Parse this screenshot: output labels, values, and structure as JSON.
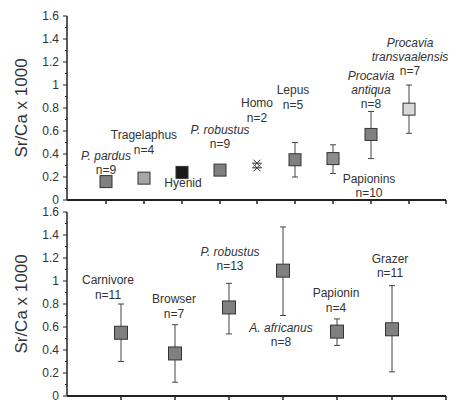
{
  "chart_data": [
    {
      "type": "scatter",
      "title": "",
      "ylabel": "Sr/Ca x 1000",
      "xlabel": "",
      "ylim": [
        0,
        1.6
      ],
      "yticks": [
        "0",
        "0.2",
        "0.4",
        "0.6",
        "0.8",
        "1",
        "1.2",
        "1.4",
        "1.6"
      ],
      "grid": false,
      "legend": "none",
      "categories": [
        "P. pardus",
        "Tragelaphus",
        "Hyenid",
        "P. robustus",
        "Homo",
        "Lepus",
        "Papionins",
        "Procavia antiqua",
        "Procavia transvaalensis"
      ],
      "series": [
        {
          "name": "P. pardus",
          "n": "n=9",
          "mean": 0.16,
          "err_low": null,
          "err_high": null,
          "italic": true,
          "color": "#808080"
        },
        {
          "name": "Tragelaphus",
          "n": "n=4",
          "mean": 0.19,
          "err_low": 0.17,
          "err_high": 0.21,
          "italic": false,
          "color": "#a6a6a6"
        },
        {
          "name": "Hyenid",
          "n": "",
          "mean": 0.24,
          "err_low": null,
          "err_high": null,
          "italic": false,
          "color": "#1a1a1a"
        },
        {
          "name": "P. robustus",
          "n": "n=9",
          "mean": 0.26,
          "err_low": null,
          "err_high": null,
          "italic": true,
          "color": "#808080"
        },
        {
          "name": "Homo",
          "n": "n=2",
          "values": [
            0.28,
            0.32
          ],
          "marker": "asterisk",
          "italic": false,
          "color": "#333333"
        },
        {
          "name": "Lepus",
          "n": "n=5",
          "mean": 0.35,
          "err_low": 0.2,
          "err_high": 0.5,
          "italic": false,
          "color": "#808080"
        },
        {
          "name": "Papionins",
          "n": "n=10",
          "mean": 0.36,
          "err_low": 0.23,
          "err_high": 0.48,
          "italic": false,
          "color": "#8c8c8c"
        },
        {
          "name": "Procavia antiqua",
          "n": "n=8",
          "mean": 0.57,
          "err_low": 0.36,
          "err_high": 0.77,
          "italic": true,
          "color": "#808080"
        },
        {
          "name": "Procavia transvaalensis",
          "n": "n=7",
          "mean": 0.79,
          "err_low": 0.58,
          "err_high": 1.0,
          "italic": true,
          "color": "#d9d9d9"
        }
      ]
    },
    {
      "type": "scatter",
      "title": "",
      "ylabel": "Sr/Ca x 1000",
      "xlabel": "",
      "ylim": [
        0,
        1.6
      ],
      "yticks": [
        "0",
        "0.2",
        "0.4",
        "0.6",
        "0.8",
        "1",
        "1.2",
        "1.4",
        "1.6"
      ],
      "grid": false,
      "legend": "none",
      "categories": [
        "Carnivore",
        "Browser",
        "P. robustus",
        "A. africanus",
        "Papionin",
        "Grazer"
      ],
      "series": [
        {
          "name": "Carnivore",
          "n": "n=11",
          "mean": 0.55,
          "err_low": 0.3,
          "err_high": 0.8,
          "italic": false,
          "color": "#808080"
        },
        {
          "name": "Browser",
          "n": "n=7",
          "mean": 0.37,
          "err_low": 0.12,
          "err_high": 0.62,
          "italic": false,
          "color": "#808080"
        },
        {
          "name": "P. robustus",
          "n": "n=13",
          "mean": 0.77,
          "err_low": 0.54,
          "err_high": 0.98,
          "italic": true,
          "color": "#808080"
        },
        {
          "name": "A. africanus",
          "n": "n=8",
          "mean": 1.09,
          "err_low": 0.7,
          "err_high": 1.47,
          "italic": true,
          "color": "#808080"
        },
        {
          "name": "Papionin",
          "n": "n=4",
          "mean": 0.56,
          "err_low": 0.44,
          "err_high": 0.67,
          "italic": false,
          "color": "#808080"
        },
        {
          "name": "Grazer",
          "n": "n=11",
          "mean": 0.58,
          "err_low": 0.21,
          "err_high": 0.96,
          "italic": false,
          "color": "#808080"
        }
      ]
    }
  ],
  "layout": {
    "top": {
      "plot_left": 67,
      "plot_right": 446,
      "y0": 200,
      "y16": 16,
      "xs": [
        106,
        144,
        182,
        220,
        257,
        295,
        333,
        371,
        409
      ],
      "xticks": [
        106,
        144,
        182,
        220,
        257,
        295,
        333,
        371,
        409,
        446
      ],
      "labels": [
        {
          "lines": [
            "P. pardus",
            "n=9"
          ],
          "x": 106,
          "y": [
            160,
            174
          ],
          "italic": [
            true,
            false
          ]
        },
        {
          "lines": [
            "Tragelaphus",
            "n=4"
          ],
          "x": 144,
          "y": [
            139,
            154
          ],
          "italic": [
            false,
            false
          ]
        },
        {
          "lines": [
            "Hyenid"
          ],
          "x": 183,
          "y": [
            187
          ],
          "italic": [
            false
          ]
        },
        {
          "lines": [
            "P. robustus",
            "n=9"
          ],
          "x": 220,
          "y": [
            134,
            148
          ],
          "italic": [
            true,
            false
          ]
        },
        {
          "lines": [
            "Homo",
            "n=2"
          ],
          "x": 257,
          "y": [
            107,
            122
          ],
          "italic": [
            false,
            false
          ]
        },
        {
          "lines": [
            "Lepus",
            "n=5"
          ],
          "x": 293,
          "y": [
            94,
            109
          ],
          "italic": [
            false,
            false
          ]
        },
        {
          "lines": [
            "Papionins",
            "n=10"
          ],
          "x": 369,
          "y": [
            183,
            197
          ],
          "italic": [
            false,
            false
          ]
        },
        {
          "lines": [
            "Procavia",
            "antiqua",
            "n=8"
          ],
          "x": 371,
          "y": [
            80,
            94,
            108
          ],
          "italic": [
            true,
            true,
            false
          ]
        },
        {
          "lines": [
            "Procavia",
            "transvaalensis",
            "n=7"
          ],
          "x": 410,
          "y": [
            47,
            61,
            75
          ],
          "italic": [
            true,
            true,
            false
          ]
        }
      ]
    },
    "bottom": {
      "plot_left": 67,
      "plot_right": 446,
      "y0": 396,
      "y16": 212,
      "xs": [
        121,
        175,
        229,
        283,
        337,
        392
      ],
      "xticks": [
        121,
        175,
        229,
        283,
        337,
        392,
        446
      ],
      "labels": [
        {
          "lines": [
            "Carnivore",
            "n=11"
          ],
          "x": 108,
          "y": [
            284,
            299
          ],
          "italic": [
            false,
            false
          ]
        },
        {
          "lines": [
            "Browser",
            "n=7"
          ],
          "x": 174,
          "y": [
            303,
            318
          ],
          "italic": [
            false,
            false
          ]
        },
        {
          "lines": [
            "P. robustus",
            "n=13"
          ],
          "x": 230,
          "y": [
            256,
            270
          ],
          "italic": [
            true,
            false
          ]
        },
        {
          "lines": [
            "A. africanus",
            "n=8"
          ],
          "x": 281,
          "y": [
            332,
            346
          ],
          "italic": [
            true,
            false
          ]
        },
        {
          "lines": [
            "Papionin",
            "n=4"
          ],
          "x": 336,
          "y": [
            297,
            312
          ],
          "italic": [
            false,
            false
          ]
        },
        {
          "lines": [
            "Grazer",
            "n=11"
          ],
          "x": 390,
          "y": [
            263,
            277
          ],
          "italic": [
            false,
            false
          ]
        }
      ]
    }
  }
}
